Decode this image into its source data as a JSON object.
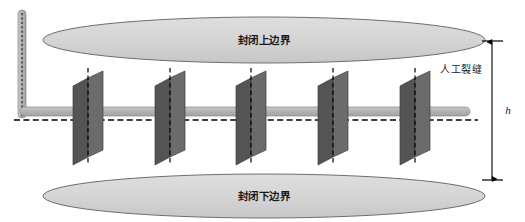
{
  "figure": {
    "type": "engineering-schematic",
    "background_color": "#ffffff"
  },
  "labels": {
    "upper_boundary": "封闭上边界",
    "lower_boundary": "封闭下边界",
    "fracture_annotation": "人工裂缝",
    "height_dimension": "h"
  },
  "colors": {
    "boundary_fill": "#d4d4d4",
    "boundary_stroke": "#6e6e6e",
    "fracture_front": "#6b6b6b",
    "fracture_side": "#545454",
    "wellbore_fill": "#b0b0b0",
    "wellbore_stroke": "#8f8f8f",
    "centerline": "#000000",
    "dimension_line": "#000000"
  },
  "geometry": {
    "canvas": {
      "width": 525,
      "height": 222
    },
    "upper_boundary_ellipse": {
      "cx": 264,
      "cy": 40,
      "rx": 221,
      "ry": 23
    },
    "lower_boundary_ellipse": {
      "cx": 264,
      "cy": 196,
      "rx": 221,
      "ry": 22
    },
    "horizontal_wellbore": {
      "x1": 22,
      "x2": 468,
      "y": 111,
      "thickness": 9
    },
    "vertical_wellbore": {
      "x": 22,
      "y_top": 10,
      "y_bottom": 116,
      "thickness": 8
    },
    "horizontal_centerline_y": 120,
    "fracture_count": 5,
    "fracture_centers_x": [
      88,
      170,
      251,
      333,
      415
    ],
    "fracture_top_y": 68,
    "fracture_bottom_y": 165,
    "dimension_arrow": {
      "x": 492,
      "y_top": 41,
      "y_bottom": 180
    }
  },
  "elements": {
    "fractures": [
      {
        "index": 1,
        "center_x": 88
      },
      {
        "index": 2,
        "center_x": 170
      },
      {
        "index": 3,
        "center_x": 251
      },
      {
        "index": 4,
        "center_x": 333
      },
      {
        "index": 5,
        "center_x": 415
      }
    ]
  }
}
